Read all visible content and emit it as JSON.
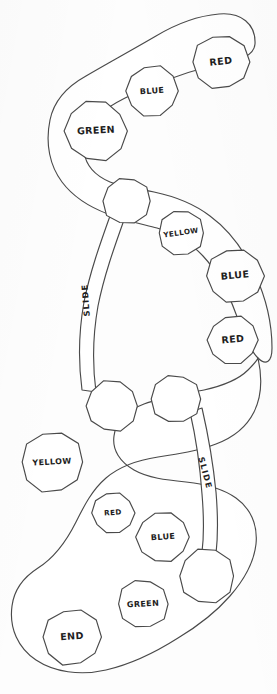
{
  "artwork": {
    "title": "Hand-drawn board game path sketch",
    "medium": "pen on paper",
    "background_color": "#fdfdfd",
    "ink_color": "#4a4a4a",
    "text_color": "#1e1e1e"
  },
  "board": {
    "width": 277,
    "height": 694,
    "spaces": [
      {
        "id": "space-red-1",
        "label": "RED",
        "cx": 221,
        "cy": 62,
        "r": 28,
        "size": "normal",
        "rotate": -6
      },
      {
        "id": "space-blue-1",
        "label": "BLUE",
        "cx": 152,
        "cy": 91,
        "r": 26,
        "size": "small",
        "rotate": -4
      },
      {
        "id": "space-green-1",
        "label": "GREEN",
        "cx": 96,
        "cy": 131,
        "r": 31,
        "size": "normal",
        "rotate": -3
      },
      {
        "id": "space-blank-1",
        "label": "",
        "cx": 127,
        "cy": 201,
        "r": 24,
        "size": "normal",
        "rotate": 0
      },
      {
        "id": "space-yellow-1",
        "label": "YELLOW",
        "cx": 181,
        "cy": 233,
        "r": 23,
        "size": "tiny",
        "rotate": -8
      },
      {
        "id": "space-blue-2",
        "label": "BLUE",
        "cx": 235,
        "cy": 276,
        "r": 28,
        "size": "normal",
        "rotate": -5
      },
      {
        "id": "space-red-2",
        "label": "RED",
        "cx": 233,
        "cy": 340,
        "r": 25,
        "size": "normal",
        "rotate": -5
      },
      {
        "id": "space-blank-2",
        "label": "",
        "cx": 112,
        "cy": 406,
        "r": 26,
        "size": "normal",
        "rotate": 0
      },
      {
        "id": "space-blank-3",
        "label": "",
        "cx": 176,
        "cy": 399,
        "r": 25,
        "size": "normal",
        "rotate": 0
      },
      {
        "id": "space-yellow-2",
        "label": "YELLOW",
        "cx": 52,
        "cy": 462,
        "r": 31,
        "size": "small",
        "rotate": -3
      },
      {
        "id": "space-red-3",
        "label": "RED",
        "cx": 113,
        "cy": 513,
        "r": 21,
        "size": "tiny",
        "rotate": -4
      },
      {
        "id": "space-blue-3",
        "label": "BLUE",
        "cx": 163,
        "cy": 537,
        "r": 26,
        "size": "small",
        "rotate": -4
      },
      {
        "id": "space-blank-4",
        "label": "",
        "cx": 207,
        "cy": 576,
        "r": 28,
        "size": "normal",
        "rotate": 0
      },
      {
        "id": "space-green-2",
        "label": "GREEN",
        "cx": 143,
        "cy": 604,
        "r": 25,
        "size": "small",
        "rotate": -3
      },
      {
        "id": "space-end",
        "label": "END",
        "cx": 72,
        "cy": 637,
        "r": 29,
        "size": "normal",
        "rotate": -4
      }
    ],
    "slides": [
      {
        "id": "slide-1",
        "label": "SLIDE",
        "x": 86,
        "y": 300,
        "rotate": -94,
        "from": "space-blank-1",
        "to": "space-blank-2"
      },
      {
        "id": "slide-2",
        "label": "SLIDE",
        "x": 205,
        "y": 473,
        "rotate": 75,
        "from": "space-blank-3",
        "to": "space-blank-4"
      }
    ]
  }
}
